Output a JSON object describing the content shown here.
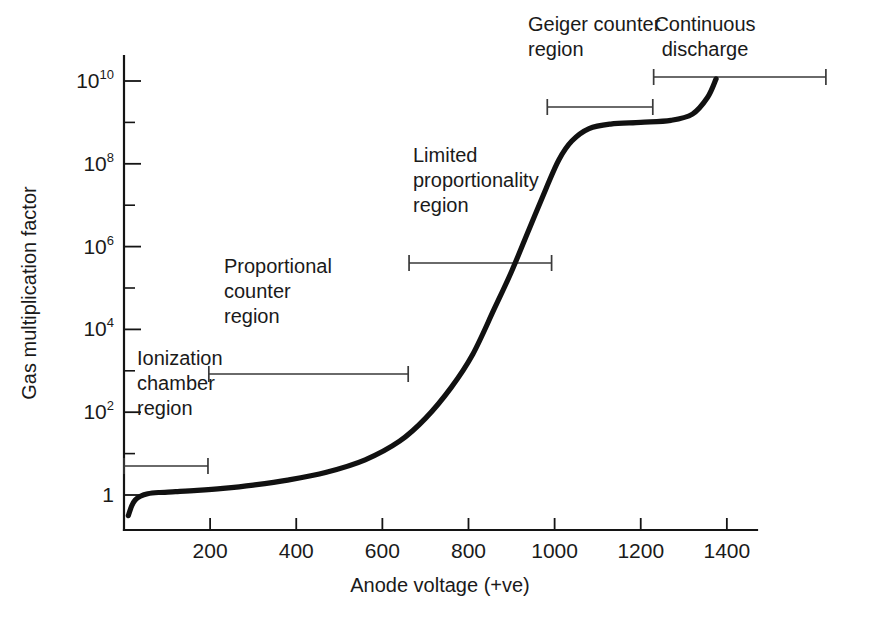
{
  "chart_data": {
    "type": "line",
    "title": "",
    "xlabel": "Anode voltage (+ve)",
    "ylabel": "Gas multiplication factor",
    "xlim": [
      0,
      1470
    ],
    "ylim_log10": [
      -0.55,
      10.9
    ],
    "grid": false,
    "legend": null,
    "x_ticks": [
      "200",
      "400",
      "600",
      "800",
      "1000",
      "1200",
      "1400"
    ],
    "x_tick_values": [
      200,
      400,
      600,
      800,
      1000,
      1200,
      1400
    ],
    "y_ticks": [
      {
        "mantissa": "10",
        "exponent": "10",
        "value_log10": 10
      },
      {
        "mantissa": "10",
        "exponent": "8",
        "value_log10": 8
      },
      {
        "mantissa": "10",
        "exponent": "6",
        "value_log10": 6
      },
      {
        "mantissa": "10",
        "exponent": "4",
        "value_log10": 4
      },
      {
        "mantissa": "10",
        "exponent": "2",
        "value_log10": 2
      },
      {
        "mantissa": "1",
        "exponent": "",
        "value_log10": 0
      }
    ],
    "y_minor_tick_log10": [
      9,
      7,
      5,
      3,
      1
    ],
    "series": [
      {
        "name": "Gas multiplication factor vs anode voltage",
        "x": [
          10,
          18,
          26,
          38,
          55,
          80,
          120,
          170,
          230,
          300,
          380,
          470,
          560,
          640,
          700,
          760,
          810,
          860,
          900,
          940,
          980,
          1010,
          1040,
          1080,
          1130,
          1200,
          1270,
          1320,
          1355,
          1375
        ],
        "y_log10": [
          -0.5,
          -0.26,
          -0.12,
          -0.03,
          0.03,
          0.06,
          0.08,
          0.11,
          0.16,
          0.24,
          0.36,
          0.55,
          0.85,
          1.3,
          1.85,
          2.6,
          3.4,
          4.5,
          5.4,
          6.4,
          7.4,
          8.1,
          8.55,
          8.85,
          8.96,
          9.0,
          9.05,
          9.2,
          9.6,
          10.05
        ]
      }
    ],
    "regions": [
      {
        "id": "ionization-chamber",
        "label_lines": [
          "Ionization",
          "chamber",
          "region"
        ],
        "x_start": 0,
        "x_end": 195
      },
      {
        "id": "proportional-counter",
        "label_lines": [
          "Proportional",
          "counter",
          "region"
        ],
        "x_start": 197,
        "x_end": 660
      },
      {
        "id": "limited-proportionality",
        "label_lines": [
          "Limited",
          "proportionality",
          "region"
        ],
        "x_start": 662,
        "x_end": 993
      },
      {
        "id": "geiger-counter",
        "label_lines": [
          "Geiger counter",
          "region"
        ],
        "x_start": 983,
        "x_end": 1228
      },
      {
        "id": "continuous-discharge",
        "label_lines": [
          "Continuous",
          "discharge"
        ],
        "x_start": 1230,
        "x_end": 1630
      }
    ],
    "colors": {
      "curve": "#111111",
      "axis": "#141414",
      "bracket": "#3a3a3a",
      "text": "#1a1a1a",
      "background": "#ffffff"
    }
  }
}
